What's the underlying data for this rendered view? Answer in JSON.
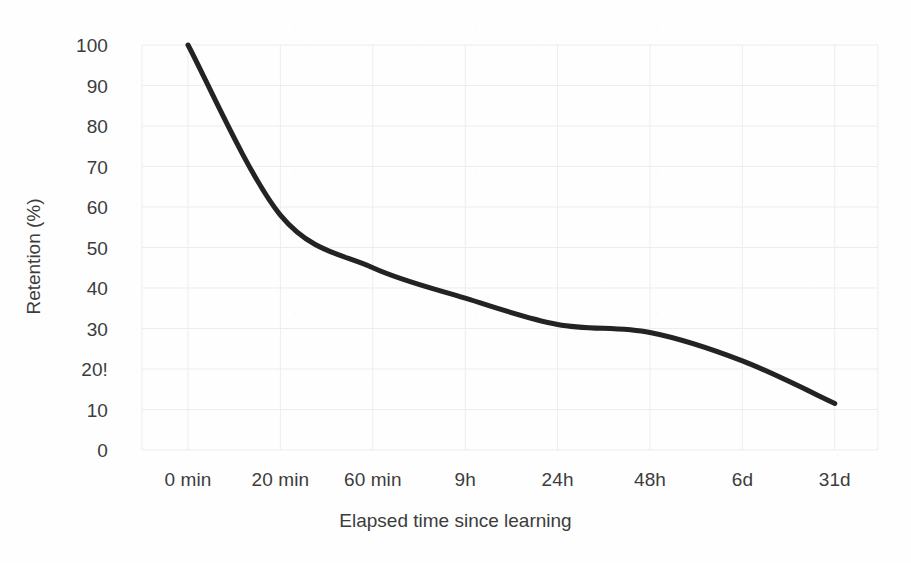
{
  "chart_data": {
    "type": "line",
    "title": "",
    "xlabel": "Elapsed time since learning",
    "ylabel": "Retention (%)",
    "categories": [
      "0 min",
      "20 min",
      "60 min",
      "9h",
      "24h",
      "48h",
      "6d",
      "31d"
    ],
    "x_tick_labels": [
      "0 min",
      "20 min",
      "60 min",
      "9h",
      "24h",
      "48h",
      "6d",
      "31d"
    ],
    "y_tick_labels": [
      "0",
      "10",
      "20!",
      "30",
      "40",
      "50",
      "60",
      "70",
      "80",
      "90",
      "100"
    ],
    "y_tick_values": [
      0,
      10,
      20,
      30,
      40,
      50,
      60,
      70,
      80,
      90,
      100
    ],
    "ylim": [
      0,
      100
    ],
    "xlim": [
      0,
      7
    ],
    "grid": true,
    "legend": false,
    "legend_position": "none",
    "series": [
      {
        "name": "Retention",
        "x": [
          "0 min",
          "20 min",
          "60 min",
          "9h",
          "24h",
          "48h",
          "6d",
          "31d"
        ],
        "values": [
          100,
          58,
          45,
          37.5,
          31,
          29,
          22,
          11.5
        ],
        "color": "#232323",
        "line_width": 5
      }
    ],
    "annotations": []
  },
  "style": {
    "background": "#fefefe",
    "grid_color": "#ededed",
    "text_color": "#3c3c3c",
    "curve_color": "#232323"
  }
}
